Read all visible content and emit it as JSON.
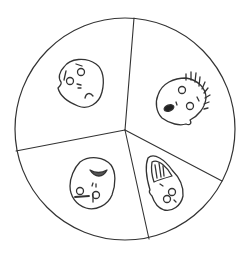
{
  "diagram": {
    "type": "emotion-wheel",
    "sections": [
      {
        "position": "top-left",
        "emotion": "sad"
      },
      {
        "position": "top-right",
        "emotion": "surprised"
      },
      {
        "position": "bottom-left",
        "emotion": "angry"
      },
      {
        "position": "bottom-right",
        "emotion": "happy"
      }
    ],
    "colors": {
      "stroke": "#333333",
      "background": "#ffffff"
    }
  }
}
